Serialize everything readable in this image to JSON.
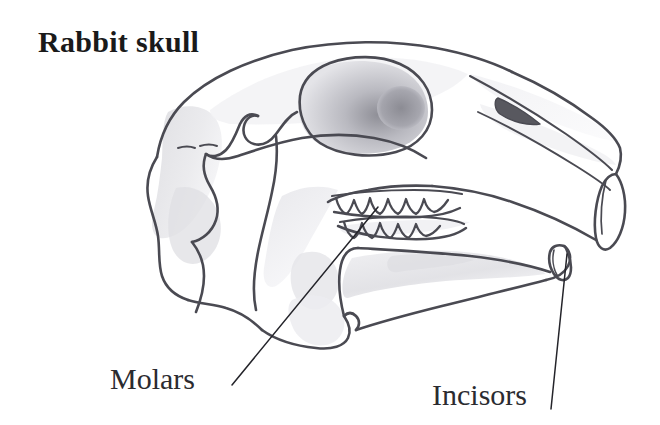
{
  "figure": {
    "title": "Rabbit skull",
    "background_color": "#ffffff",
    "ink_color": "#4a4a52",
    "title_color": "#1a1a1a",
    "label_color": "#2b2b30",
    "shade_light": "#e8e8ea",
    "shade_mid": "#d2d2d6",
    "shade_dark": "#9a9aa0",
    "foramen_color": "#58585f"
  },
  "labels": [
    {
      "id": "molars",
      "text": "Molars",
      "leader_from": [
        232,
        385
      ],
      "leader_to": [
        378,
        207
      ]
    },
    {
      "id": "incisors",
      "text": "Incisors",
      "leader_from": [
        551,
        409
      ],
      "leader_to": [
        567,
        254
      ]
    }
  ],
  "anatomy": {
    "parts": [
      "cranium",
      "orbit",
      "zygomatic-arch",
      "nasal-bone",
      "maxilla",
      "mandible",
      "upper-incisor",
      "lower-incisor",
      "upper-molar-row",
      "lower-molar-row",
      "occipital-region",
      "nasal-foramen"
    ],
    "upper_molar_cusps": 5,
    "lower_molar_cusps": 5
  }
}
